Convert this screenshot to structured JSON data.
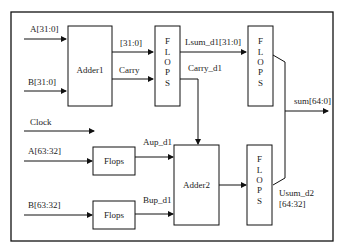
{
  "diagram": {
    "type": "block-diagram",
    "inputs": {
      "a_low": "A[31:0]",
      "b_low": "B[31:0]",
      "clock": "Clock",
      "a_high": "A[63:32]",
      "b_high": "B[63:32]"
    },
    "blocks": {
      "adder1": "Adder1",
      "adder2": "Adder2",
      "flops_a": "Flops",
      "flops_b": "Flops",
      "flops_stage1": [
        "F",
        "L",
        "O",
        "P",
        "S"
      ],
      "flops_stage2_low": [
        "F",
        "L",
        "O",
        "P",
        "S"
      ],
      "flops_stage2_high": [
        "F",
        "L",
        "O",
        "P",
        "S"
      ]
    },
    "signals": {
      "adder1_sum": "[31:0]",
      "carry": "Carry",
      "lsum_d1": "Lsum_d1[31:0]",
      "carry_d1": "Carry_d1",
      "aup_d1": "Aup_d1",
      "bup_d1": "Bup_d1",
      "usum_d2_line1": "Usum_d2",
      "usum_d2_line2": "[64:32]"
    },
    "output": "sum[64:0]"
  }
}
